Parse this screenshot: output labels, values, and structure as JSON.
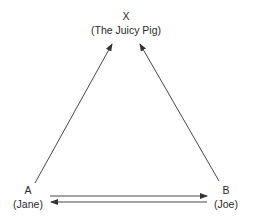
{
  "diagram": {
    "type": "triangle-relationship",
    "nodes": {
      "x": {
        "letter": "X",
        "name": "(The Juicy Pig)"
      },
      "a": {
        "letter": "A",
        "name": "(Jane)"
      },
      "b": {
        "letter": "B",
        "name": "(Joe)"
      }
    },
    "edges": [
      {
        "from": "A",
        "to": "X"
      },
      {
        "from": "B",
        "to": "X"
      },
      {
        "from": "A",
        "to": "B"
      },
      {
        "from": "B",
        "to": "A"
      }
    ],
    "colors": {
      "line": "#333333",
      "text": "#2a2a2a",
      "background": "#ffffff"
    }
  }
}
